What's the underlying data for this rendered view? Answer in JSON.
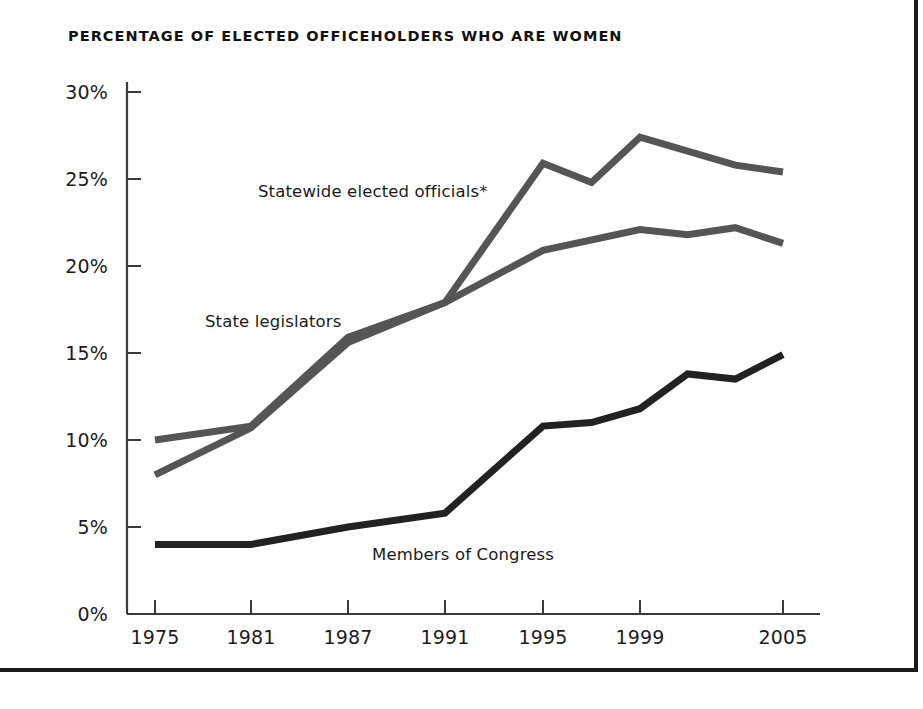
{
  "figure": {
    "title": "PERCENTAGE OF ELECTED OFFICEHOLDERS WHO ARE WOMEN",
    "background": "#ffffff",
    "frame_color": "#1a1a1a",
    "axis_color": "#3a3a3a"
  },
  "chart_data": {
    "type": "line",
    "title": "PERCENTAGE OF ELECTED OFFICEHOLDERS WHO ARE WOMEN",
    "xlabel": "",
    "ylabel": "",
    "xlim": [
      1975,
      2005
    ],
    "ylim": [
      0,
      30
    ],
    "ytick_labels": [
      "0%",
      "5%",
      "10%",
      "15%",
      "20%",
      "25%",
      "30%"
    ],
    "ytick_values": [
      0,
      5,
      10,
      15,
      20,
      25,
      30
    ],
    "xtick_labels": [
      "1975",
      "1981",
      "1987",
      "1991",
      "1995",
      "1999",
      "2005"
    ],
    "xtick_values": [
      1975,
      1981,
      1987,
      1991,
      1995,
      1999,
      2005
    ],
    "grid": false,
    "legend": "inline-labels",
    "series": [
      {
        "name": "Statewide elected officials*",
        "color": "#555555",
        "label_position": "above-line",
        "x": [
          1975,
          1981,
          1987,
          1991,
          1995,
          1997,
          1999,
          2003,
          2005
        ],
        "values": [
          8.0,
          10.7,
          15.6,
          17.9,
          25.9,
          24.8,
          27.4,
          25.8,
          25.4
        ]
      },
      {
        "name": "State legislators",
        "color": "#555555",
        "label_position": "above-line",
        "x": [
          1975,
          1981,
          1987,
          1991,
          1995,
          1999,
          2001,
          2003,
          2005
        ],
        "values": [
          10.0,
          10.8,
          15.9,
          17.9,
          20.9,
          22.1,
          21.8,
          22.2,
          21.3
        ]
      },
      {
        "name": "Members of Congress",
        "color": "#222222",
        "label_position": "below-line",
        "x": [
          1975,
          1981,
          1987,
          1991,
          1995,
          1997,
          1999,
          2001,
          2003,
          2005
        ],
        "values": [
          4.0,
          4.0,
          5.0,
          5.8,
          10.8,
          11.0,
          11.8,
          13.8,
          13.5,
          14.9
        ]
      }
    ],
    "annotations": [
      {
        "text": "Statewide elected officials*",
        "x_px": 258,
        "y_px": 182
      },
      {
        "text": "State legislators",
        "x_px": 205,
        "y_px": 312
      },
      {
        "text": "Members of Congress",
        "x_px": 372,
        "y_px": 545
      }
    ]
  }
}
